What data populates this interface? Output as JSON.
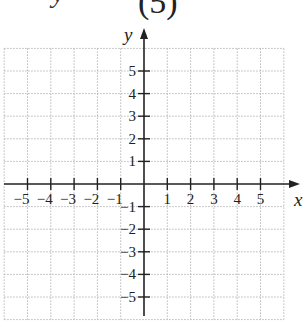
{
  "header": {
    "clipped_text": "y",
    "expression": "(5)"
  },
  "chart_data": {
    "type": "coordinate-plane",
    "title": "",
    "xlabel": "x",
    "ylabel": "y",
    "xlim": [
      -6,
      6
    ],
    "ylim": [
      -6,
      6
    ],
    "grid": "dotted",
    "x_ticks": [
      -5,
      -4,
      -3,
      -2,
      -1,
      1,
      2,
      3,
      4,
      5
    ],
    "y_ticks": [
      -5,
      -4,
      -3,
      -2,
      -1,
      1,
      2,
      3,
      4,
      5
    ],
    "x_tick_labels": [
      "−5",
      "−4",
      "−3",
      "−2",
      "−1",
      "1",
      "2",
      "3",
      "4",
      "5"
    ],
    "y_tick_labels": [
      "−5",
      "−4",
      "−3",
      "−2",
      "−1",
      "1",
      "2",
      "3",
      "4",
      "5"
    ],
    "series": []
  },
  "colors": {
    "axis": "#222222",
    "grid": "#b8b8b8",
    "background": "#ffffff"
  }
}
